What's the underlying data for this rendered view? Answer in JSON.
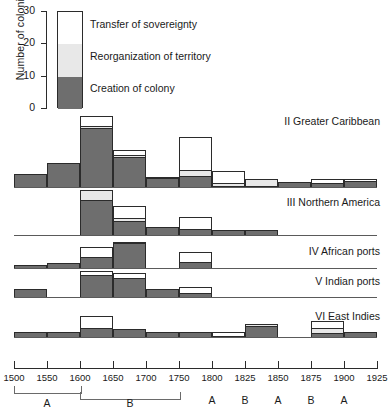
{
  "axis": {
    "y_label": "Number of colonies",
    "y_ticks": [
      "30",
      "20",
      "10",
      "0"
    ],
    "x_ticks": [
      "1500",
      "1550",
      "1600",
      "1650",
      "1700",
      "1750",
      "1800",
      "1825",
      "1850",
      "1875",
      "1900",
      "1925"
    ],
    "period_labels": [
      "A",
      "B",
      "A",
      "B",
      "A",
      "B",
      "A"
    ]
  },
  "legend": {
    "items": [
      {
        "label": "Transfer of sovereignty",
        "color": "#ffffff",
        "name": "transfer-of-sovereignty"
      },
      {
        "label": "Reorganization of territory",
        "color": "#e8e8e8",
        "name": "reorganization-of-territory"
      },
      {
        "label": "Creation of colony",
        "color": "#6e6e6e",
        "name": "creation-of-colony"
      }
    ]
  },
  "colors": {
    "creation": "#6e6e6e",
    "reorganization": "#e8e8e8",
    "transfer": "#ffffff",
    "outline": "#2b2b2b",
    "baseline": "#5a5a5a"
  },
  "chart_data": {
    "type": "bar",
    "xlabel": "",
    "ylabel": "Number of colonies",
    "ylim": [
      0,
      30
    ],
    "grid": false,
    "legend_position": "top-left",
    "stacked": true,
    "series_names": [
      "Creation of colony",
      "Reorganization of territory",
      "Transfer of sovereignty"
    ],
    "x_bins": [
      "1500-1550",
      "1550-1600",
      "1600-1650",
      "1650-1700",
      "1700-1750",
      "1750-1800",
      "1800-1825",
      "1825-1850",
      "1850-1875",
      "1875-1900",
      "1900-1925"
    ],
    "panels": [
      {
        "id": "II",
        "name": "Greater Caribbean",
        "label": "II  Greater Caribbean",
        "bins": [
          {
            "bin": "1500-1550",
            "creation": 5,
            "reorganization": 0,
            "transfer": 0
          },
          {
            "bin": "1550-1600",
            "creation": 9,
            "reorganization": 0,
            "transfer": 0
          },
          {
            "bin": "1600-1650",
            "creation": 22,
            "reorganization": 1,
            "transfer": 4
          },
          {
            "bin": "1650-1700",
            "creation": 11,
            "reorganization": 1,
            "transfer": 2
          },
          {
            "bin": "1700-1750",
            "creation": 3,
            "reorganization": 1,
            "transfer": 0
          },
          {
            "bin": "1750-1800",
            "creation": 4,
            "reorganization": 2,
            "transfer": 13
          },
          {
            "bin": "1800-1825",
            "creation": 0,
            "reorganization": 1,
            "transfer": 5
          },
          {
            "bin": "1825-1850",
            "creation": 0,
            "reorganization": 3,
            "transfer": 0
          },
          {
            "bin": "1850-1875",
            "creation": 2,
            "reorganization": 0,
            "transfer": 0
          },
          {
            "bin": "1875-1900",
            "creation": 1,
            "reorganization": 0,
            "transfer": 2
          },
          {
            "bin": "1900-1925",
            "creation": 2,
            "reorganization": 0,
            "transfer": 1
          }
        ]
      },
      {
        "id": "III",
        "name": "Northern America",
        "label": "III  Northern America",
        "bins": [
          {
            "bin": "1500-1550",
            "creation": 0,
            "reorganization": 0,
            "transfer": 0
          },
          {
            "bin": "1550-1600",
            "creation": 0,
            "reorganization": 0,
            "transfer": 0
          },
          {
            "bin": "1600-1650",
            "creation": 13,
            "reorganization": 4,
            "transfer": 0
          },
          {
            "bin": "1650-1700",
            "creation": 5,
            "reorganization": 1,
            "transfer": 5
          },
          {
            "bin": "1700-1750",
            "creation": 3,
            "reorganization": 0,
            "transfer": 0
          },
          {
            "bin": "1750-1800",
            "creation": 2,
            "reorganization": 0,
            "transfer": 5
          },
          {
            "bin": "1800-1825",
            "creation": 2,
            "reorganization": 0,
            "transfer": 0
          },
          {
            "bin": "1825-1850",
            "creation": 2,
            "reorganization": 0,
            "transfer": 0
          },
          {
            "bin": "1850-1875",
            "creation": 0,
            "reorganization": 0,
            "transfer": 0
          },
          {
            "bin": "1875-1900",
            "creation": 0,
            "reorganization": 0,
            "transfer": 0
          },
          {
            "bin": "1900-1925",
            "creation": 0,
            "reorganization": 0,
            "transfer": 0
          }
        ]
      },
      {
        "id": "IV",
        "name": "African ports",
        "label": "IV  African ports",
        "bins": [
          {
            "bin": "1500-1550",
            "creation": 1,
            "reorganization": 0,
            "transfer": 0
          },
          {
            "bin": "1550-1600",
            "creation": 2,
            "reorganization": 0,
            "transfer": 0
          },
          {
            "bin": "1600-1650",
            "creation": 4,
            "reorganization": 0,
            "transfer": 4
          },
          {
            "bin": "1650-1700",
            "creation": 9,
            "reorganization": 0,
            "transfer": 1
          },
          {
            "bin": "1700-1750",
            "creation": 0,
            "reorganization": 0,
            "transfer": 0
          },
          {
            "bin": "1750-1800",
            "creation": 2,
            "reorganization": 0,
            "transfer": 4
          },
          {
            "bin": "1800-1825",
            "creation": 0,
            "reorganization": 0,
            "transfer": 0
          },
          {
            "bin": "1825-1850",
            "creation": 0,
            "reorganization": 0,
            "transfer": 0
          },
          {
            "bin": "1850-1875",
            "creation": 0,
            "reorganization": 0,
            "transfer": 0
          },
          {
            "bin": "1875-1900",
            "creation": 0,
            "reorganization": 0,
            "transfer": 0
          },
          {
            "bin": "1900-1925",
            "creation": 0,
            "reorganization": 0,
            "transfer": 0
          }
        ]
      },
      {
        "id": "V",
        "name": "Indian ports",
        "label": "V  Indian ports",
        "bins": [
          {
            "bin": "1500-1550",
            "creation": 3,
            "reorganization": 0,
            "transfer": 0
          },
          {
            "bin": "1550-1600",
            "creation": 0,
            "reorganization": 0,
            "transfer": 0
          },
          {
            "bin": "1600-1650",
            "creation": 8,
            "reorganization": 0,
            "transfer": 2
          },
          {
            "bin": "1650-1700",
            "creation": 7,
            "reorganization": 0,
            "transfer": 2
          },
          {
            "bin": "1700-1750",
            "creation": 3,
            "reorganization": 0,
            "transfer": 0
          },
          {
            "bin": "1750-1800",
            "creation": 1,
            "reorganization": 0,
            "transfer": 3
          },
          {
            "bin": "1800-1825",
            "creation": 0,
            "reorganization": 0,
            "transfer": 0
          },
          {
            "bin": "1825-1850",
            "creation": 0,
            "reorganization": 0,
            "transfer": 0
          },
          {
            "bin": "1850-1875",
            "creation": 0,
            "reorganization": 0,
            "transfer": 0
          },
          {
            "bin": "1875-1900",
            "creation": 0,
            "reorganization": 0,
            "transfer": 0
          },
          {
            "bin": "1900-1925",
            "creation": 0,
            "reorganization": 0,
            "transfer": 0
          }
        ]
      },
      {
        "id": "VI",
        "name": "East Indies",
        "label": "VI  East Indies",
        "bins": [
          {
            "bin": "1500-1550",
            "creation": 2,
            "reorganization": 0,
            "transfer": 0
          },
          {
            "bin": "1550-1600",
            "creation": 2,
            "reorganization": 0,
            "transfer": 0
          },
          {
            "bin": "1600-1650",
            "creation": 3,
            "reorganization": 0,
            "transfer": 5
          },
          {
            "bin": "1650-1700",
            "creation": 3,
            "reorganization": 0,
            "transfer": 0
          },
          {
            "bin": "1700-1750",
            "creation": 2,
            "reorganization": 0,
            "transfer": 0
          },
          {
            "bin": "1750-1800",
            "creation": 2,
            "reorganization": 0,
            "transfer": 0
          },
          {
            "bin": "1800-1825",
            "creation": 0,
            "reorganization": 0,
            "transfer": 2
          },
          {
            "bin": "1825-1850",
            "creation": 4,
            "reorganization": 1,
            "transfer": 0
          },
          {
            "bin": "1850-1875",
            "creation": 0,
            "reorganization": 0,
            "transfer": 0
          },
          {
            "bin": "1875-1900",
            "creation": 1,
            "reorganization": 2,
            "transfer": 3
          },
          {
            "bin": "1900-1925",
            "creation": 2,
            "reorganization": 0,
            "transfer": 0
          }
        ]
      }
    ]
  }
}
